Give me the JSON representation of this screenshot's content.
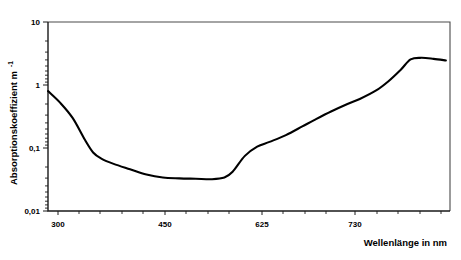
{
  "chart_data": {
    "type": "line",
    "title": "",
    "subtitle": "",
    "xlabel": "Wellenlänge in nm",
    "ylabel": "Absorptionskoeffizient m",
    "ylabel_exponent": "-1",
    "xlim": [
      300,
      790
    ],
    "ylim": [
      0.01,
      10
    ],
    "yscale": "log",
    "xscale": "linear",
    "grid": false,
    "legend": null,
    "xticks": [
      300,
      450,
      625,
      730
    ],
    "xtick_labels": [
      "300",
      "450",
      "625",
      "730"
    ],
    "yticks": [
      0.01,
      0.1,
      1,
      10
    ],
    "ytick_labels": [
      "0,01",
      "0,1",
      "1",
      "10"
    ],
    "series": [
      {
        "name": "Absorptionskoeffizient von Wasser",
        "x": [
          300,
          315,
          330,
          345,
          355,
          365,
          380,
          400,
          420,
          440,
          460,
          480,
          500,
          515,
          525,
          540,
          555,
          570,
          590,
          610,
          625,
          645,
          665,
          680,
          700,
          715,
          730,
          742,
          755,
          770,
          785
        ],
        "y": [
          0.8,
          0.52,
          0.3,
          0.135,
          0.085,
          0.068,
          0.056,
          0.046,
          0.038,
          0.034,
          0.033,
          0.0325,
          0.032,
          0.034,
          0.042,
          0.075,
          0.105,
          0.125,
          0.16,
          0.22,
          0.28,
          0.38,
          0.5,
          0.6,
          0.82,
          1.15,
          1.75,
          2.55,
          2.7,
          2.6,
          2.45
        ]
      }
    ],
    "annotations": []
  }
}
